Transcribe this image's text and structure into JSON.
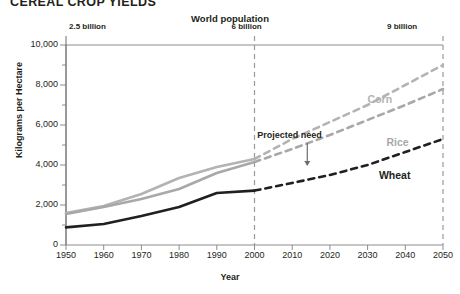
{
  "title": "CEREAL CROP YIELDS",
  "top_axis": {
    "label": "World population",
    "ticks": [
      {
        "year": 1950,
        "text": "2.5 billion"
      },
      {
        "year": 2000,
        "text": "6 billion"
      },
      {
        "year": 2050,
        "text": "9 billion"
      }
    ]
  },
  "annotation": {
    "text": "Projected need"
  },
  "chart_data": {
    "type": "line",
    "title": "CEREAL CROP YIELDS",
    "xlabel": "Year",
    "ylabel": "Kilograms per Hectare",
    "xlim": [
      1950,
      2050
    ],
    "ylim": [
      0,
      10000
    ],
    "xticks": [
      1950,
      1960,
      1970,
      1980,
      1990,
      2000,
      2010,
      2020,
      2030,
      2040,
      2050
    ],
    "yticks": [
      0,
      2000,
      4000,
      6000,
      8000,
      10000
    ],
    "ytick_labels": [
      "0",
      "2,000",
      "4,000",
      "6,000",
      "8,000",
      "10,000"
    ],
    "grid": false,
    "legend": "inline-labels",
    "projection_start": 2000,
    "x": [
      1950,
      1960,
      1970,
      1980,
      1990,
      2000,
      2010,
      2020,
      2030,
      2040,
      2050
    ],
    "series": [
      {
        "name": "Corn",
        "color": "#b3b3b3",
        "values": [
          1600,
          1950,
          2550,
          3350,
          3900,
          4300,
          5300,
          6150,
          7000,
          8000,
          9000
        ],
        "label_x": 2030,
        "label_y": 7250
      },
      {
        "name": "Rice",
        "color": "#a8a8a8",
        "values": [
          1550,
          1900,
          2300,
          2800,
          3600,
          4150,
          4800,
          5500,
          6250,
          7000,
          7800
        ],
        "label_x": 2035,
        "label_y": 5100
      },
      {
        "name": "Wheat",
        "color": "#231f20",
        "values": [
          880,
          1050,
          1450,
          1900,
          2600,
          2720,
          3100,
          3500,
          4000,
          4650,
          5300
        ],
        "label_x": 2033,
        "label_y": 3450
      }
    ]
  }
}
